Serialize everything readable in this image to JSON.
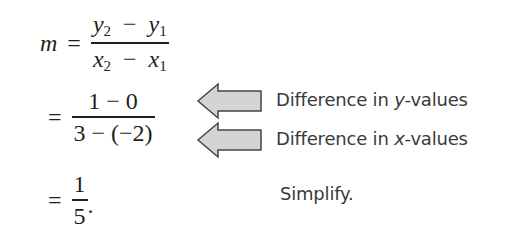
{
  "steps": [
    {
      "lhs": "m",
      "equals": "=",
      "numerator": {
        "a": "y",
        "a_sub": "2",
        "op": "−",
        "b": "y",
        "b_sub": "1"
      },
      "denominator": {
        "a": "x",
        "a_sub": "2",
        "op": "−",
        "b": "x",
        "b_sub": "1"
      }
    },
    {
      "equals": "=",
      "numerator": "1 − 0",
      "denominator": "3 − (−2)",
      "annotations": [
        {
          "prefix": "Difference in ",
          "var": "y",
          "suffix": "-values",
          "icon": "left-arrow-icon"
        },
        {
          "prefix": "Difference in ",
          "var": "x",
          "suffix": "-values",
          "icon": "left-arrow-icon"
        }
      ]
    },
    {
      "equals": "=",
      "numerator": "1",
      "denominator": "5",
      "trailing": ".",
      "annotation": "Simplify."
    }
  ],
  "colors": {
    "text": "#231f20",
    "note": "#3a3a3a",
    "arrow_fill": "#d4d4d4",
    "arrow_stroke": "#444444"
  }
}
